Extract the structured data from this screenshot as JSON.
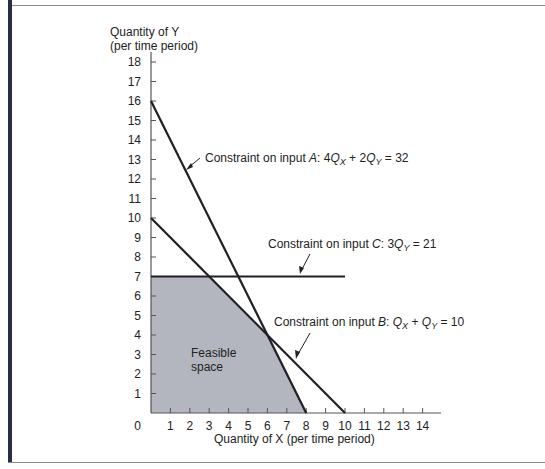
{
  "chart_data": {
    "type": "line",
    "title": "",
    "xlabel": "Quantity of X (per time period)",
    "ylabel_line1": "Quantity of Y",
    "ylabel_line2": "(per time period)",
    "xlim": [
      0,
      15
    ],
    "ylim": [
      0,
      18.5
    ],
    "x_ticks": [
      0,
      1,
      2,
      3,
      4,
      5,
      6,
      7,
      8,
      9,
      10,
      11,
      12,
      13,
      14
    ],
    "y_ticks": [
      1,
      2,
      3,
      4,
      5,
      6,
      7,
      8,
      9,
      10,
      11,
      12,
      13,
      14,
      15,
      16,
      17,
      18
    ],
    "grid": false,
    "series": [
      {
        "name": "Constraint on input A: 4Qx + 2Qy = 32",
        "points": [
          [
            0,
            16
          ],
          [
            8,
            0
          ]
        ]
      },
      {
        "name": "Constraint on input B: Qx + Qy = 10",
        "points": [
          [
            0,
            10
          ],
          [
            10,
            0
          ]
        ]
      },
      {
        "name": "Constraint on input C: 3Qy = 21",
        "points": [
          [
            0,
            7
          ],
          [
            10,
            7
          ]
        ]
      }
    ],
    "feasible_region": {
      "label_line1": "Feasible",
      "label_line2": "space",
      "vertices": [
        [
          0,
          0
        ],
        [
          0,
          7
        ],
        [
          3,
          7
        ],
        [
          6,
          4
        ],
        [
          8,
          0
        ]
      ],
      "fill": "#b4b6bf"
    },
    "annotations": [
      {
        "id": "A",
        "prefix": "Constraint on input ",
        "letter": "A",
        "colon": ": 4",
        "q1": "Q",
        "s1": "X",
        "mid": " + 2",
        "q2": "Q",
        "s2": "Y",
        "rhs": " = 32"
      },
      {
        "id": "C",
        "prefix": "Constraint on input ",
        "letter": "C",
        "colon": ": 3",
        "q1": "Q",
        "s1": "Y",
        "rhs": " = 21"
      },
      {
        "id": "B",
        "prefix": "Constraint on input ",
        "letter": "B",
        "colon": ": ",
        "q1": "Q",
        "s1": "X",
        "mid": " + ",
        "q2": "Q",
        "s2": "Y",
        "rhs": " = 10"
      }
    ],
    "colors": {
      "line": "#1f1f26",
      "axis": "#555555",
      "fill": "#b4b6bf",
      "frame": "#2a2d4a"
    }
  }
}
